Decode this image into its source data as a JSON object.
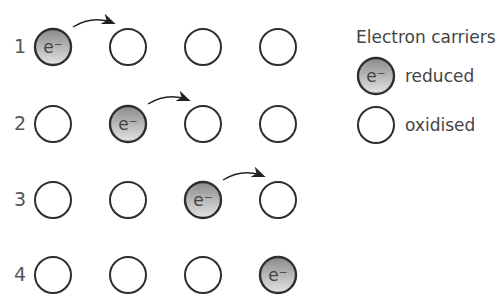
{
  "diagram": {
    "columns": 4,
    "rows": [
      {
        "label": "1",
        "reduced_index": 0,
        "arrow_from": 0
      },
      {
        "label": "2",
        "reduced_index": 1,
        "arrow_from": 1
      },
      {
        "label": "3",
        "reduced_index": 2,
        "arrow_from": 2
      },
      {
        "label": "4",
        "reduced_index": 3,
        "arrow_from": null
      }
    ],
    "electron_symbol": "e⁻"
  },
  "legend": {
    "title": "Electron carriers",
    "items": [
      {
        "label": "reduced",
        "state": "reduced"
      },
      {
        "label": "oxidised",
        "state": "oxidised"
      }
    ]
  },
  "colors": {
    "outline": "#2e2e2e",
    "reduced_fill_top": "#8c8c8c",
    "reduced_fill_bottom": "#e2e2e2",
    "stripe": "#cfcfcf",
    "text": "#4a4a4a"
  }
}
